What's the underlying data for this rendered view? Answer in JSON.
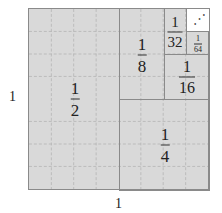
{
  "diagram": {
    "side_label_left": "1",
    "side_label_bottom": "1",
    "regions": [
      {
        "id": "half",
        "num": "1",
        "den": "2"
      },
      {
        "id": "quarter",
        "num": "1",
        "den": "4"
      },
      {
        "id": "eighth",
        "num": "1",
        "den": "8"
      },
      {
        "id": "sixteenth",
        "num": "1",
        "den": "16"
      },
      {
        "id": "thirtysecond",
        "num": "1",
        "den": "32"
      },
      {
        "id": "sixtyfourth",
        "num": "1",
        "den": "64"
      }
    ],
    "remainder_glyph": "⋰",
    "colors": {
      "fill": "#d9d9d9",
      "border": "#8a8a8a",
      "grid": "#b0b0b0",
      "remainder": "#ffffff"
    }
  }
}
